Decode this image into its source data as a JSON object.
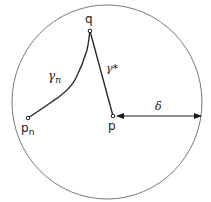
{
  "diagram": {
    "type": "geometric-illustration",
    "colors": {
      "stroke": "#2a2a2a",
      "circle": "#6a6a6a",
      "background": "#ffffff"
    },
    "circle": {
      "cx": 107,
      "cy": 102,
      "rx": 95,
      "ry": 97
    },
    "points": {
      "q": {
        "label": "q",
        "x": 90,
        "y": 31
      },
      "p": {
        "label": "p",
        "x": 113,
        "y": 116
      },
      "p_n": {
        "label": "p",
        "subscript": "n",
        "x": 28,
        "y": 118
      }
    },
    "curves": {
      "gamma_n": {
        "label": "γ",
        "subscript": "n"
      },
      "gamma_star": {
        "label": "γ*"
      }
    },
    "arrow": {
      "label": "δ",
      "from": "p",
      "to": "circle-boundary"
    }
  }
}
